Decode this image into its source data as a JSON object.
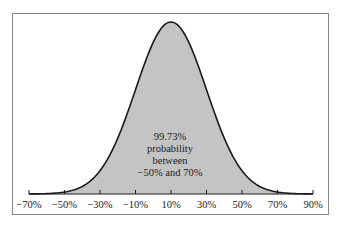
{
  "chart_data": {
    "type": "area",
    "title": "",
    "xlabel": "",
    "ylabel": "",
    "distribution": "normal",
    "mean": 10,
    "std_dev": 20,
    "xlim": [
      -70,
      90
    ],
    "x_ticks": [
      -70,
      -50,
      -30,
      -10,
      10,
      30,
      50,
      70,
      90
    ],
    "x_tick_labels": [
      "−70%",
      "−50%",
      "−30%",
      "−10%",
      "10%",
      "30%",
      "50%",
      "70%",
      "90%"
    ],
    "shaded_range": [
      -50,
      70
    ],
    "shaded_probability": 99.73,
    "grid": false,
    "legend": null,
    "annotation": [
      "99.73%",
      "probability",
      "between",
      "−50% and 70%"
    ],
    "colors": {
      "fill": "#c4c4c4",
      "curve": "#1a1a1a",
      "frame": "#8a8a8a"
    }
  }
}
